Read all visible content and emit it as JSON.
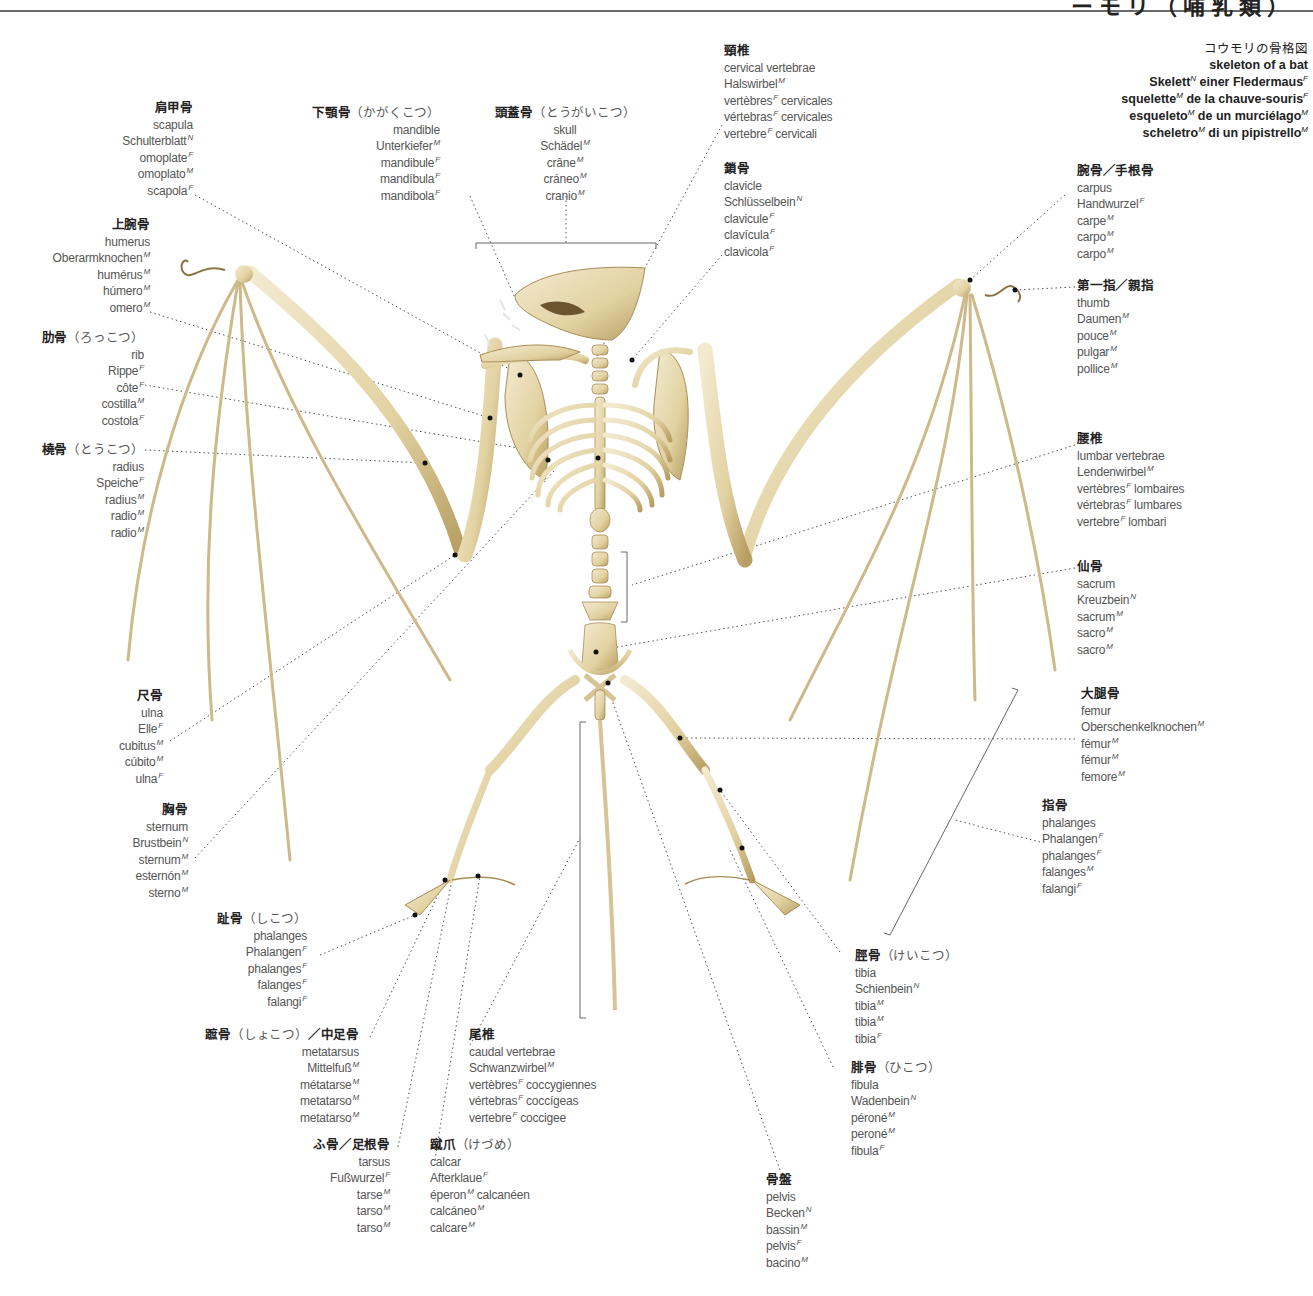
{
  "header": {
    "title_fragment": "ーモリ（哺乳類）"
  },
  "title_block": {
    "jp": "コウモリの骨格図",
    "lines": [
      {
        "text": "skeleton of a bat",
        "parts": []
      },
      {
        "text": "Skelett",
        "g1": "N",
        "rest": " einer Fledermaus",
        "g2": "F"
      },
      {
        "text": "squelette",
        "g1": "M",
        "rest": " de la chauve-souris",
        "g2": "F"
      },
      {
        "text": "esqueleto",
        "g1": "M",
        "rest": " de un murciélago",
        "g2": "M"
      },
      {
        "text": "scheletro",
        "g1": "M",
        "rest": " di un pipistrello",
        "g2": "M"
      }
    ]
  },
  "labels": {
    "scapula": {
      "jp": "肩甲骨",
      "reading": "",
      "terms": [
        [
          "scapula",
          ""
        ],
        [
          "Schulterblatt",
          "N"
        ],
        [
          "omoplate",
          "F"
        ],
        [
          "omoplato",
          "M"
        ],
        [
          "scapola",
          "F"
        ]
      ]
    },
    "humerus": {
      "jp": "上腕骨",
      "reading": "",
      "terms": [
        [
          "humerus",
          ""
        ],
        [
          "Oberarmknochen",
          "M"
        ],
        [
          "humérus",
          "M"
        ],
        [
          "húmero",
          "M"
        ],
        [
          "omero",
          "M"
        ]
      ]
    },
    "rib": {
      "jp": "肋骨",
      "reading": "（ろっこつ）",
      "terms": [
        [
          "rib",
          ""
        ],
        [
          "Rippe",
          "F"
        ],
        [
          "côte",
          "F"
        ],
        [
          "costilla",
          "M"
        ],
        [
          "costola",
          "F"
        ]
      ]
    },
    "radius": {
      "jp": "橈骨",
      "reading": "（とうこつ）",
      "terms": [
        [
          "radius",
          ""
        ],
        [
          "Speiche",
          "F"
        ],
        [
          "radius",
          "M"
        ],
        [
          "radio",
          "M"
        ],
        [
          "radio",
          "M"
        ]
      ]
    },
    "ulna": {
      "jp": "尺骨",
      "reading": "",
      "terms": [
        [
          "ulna",
          ""
        ],
        [
          "Elle",
          "F"
        ],
        [
          "cubitus",
          "M"
        ],
        [
          "cúbito",
          "M"
        ],
        [
          "ulna",
          "F"
        ]
      ]
    },
    "sternum": {
      "jp": "胸骨",
      "reading": "",
      "terms": [
        [
          "sternum",
          ""
        ],
        [
          "Brustbein",
          "N"
        ],
        [
          "sternum",
          "M"
        ],
        [
          "esternón",
          "M"
        ],
        [
          "sterno",
          "M"
        ]
      ]
    },
    "mandible": {
      "jp": "下顎骨",
      "reading": "（かがくこつ）",
      "terms": [
        [
          "mandible",
          ""
        ],
        [
          "Unterkiefer",
          "M"
        ],
        [
          "mandibule",
          "F"
        ],
        [
          "mandíbula",
          "F"
        ],
        [
          "mandibola",
          "F"
        ]
      ]
    },
    "skull": {
      "jp": "頭蓋骨",
      "reading": "（とうがいこつ）",
      "terms": [
        [
          "skull",
          ""
        ],
        [
          "Schädel",
          "M"
        ],
        [
          "crâne",
          "M"
        ],
        [
          "cráneo",
          "M"
        ],
        [
          "cranio",
          "M"
        ]
      ]
    },
    "cervical": {
      "jp": "頸椎",
      "reading": "",
      "terms": [
        [
          "cervical vertebrae",
          ""
        ],
        [
          "Halswirbel",
          "M"
        ],
        [
          "vertèbres",
          "F",
          " cervicales"
        ],
        [
          "vértebras",
          "F",
          " cervicales"
        ],
        [
          "vertebre",
          "F",
          " cervicali"
        ]
      ]
    },
    "clavicle": {
      "jp": "鎖骨",
      "reading": "",
      "terms": [
        [
          "clavicle",
          ""
        ],
        [
          "Schlüsselbein",
          "N"
        ],
        [
          "clavicule",
          "F"
        ],
        [
          "clavícula",
          "F"
        ],
        [
          "clavicola",
          "F"
        ]
      ]
    },
    "carpus": {
      "jp": "腕骨／手根骨",
      "reading": "",
      "terms": [
        [
          "carpus",
          ""
        ],
        [
          "Handwurzel",
          "F"
        ],
        [
          "carpe",
          "M"
        ],
        [
          "carpo",
          "M"
        ],
        [
          "carpo",
          "M"
        ]
      ]
    },
    "thumb": {
      "jp": "第一指／親指",
      "reading": "",
      "terms": [
        [
          "thumb",
          ""
        ],
        [
          "Daumen",
          "M"
        ],
        [
          "pouce",
          "M"
        ],
        [
          "pulgar",
          "M"
        ],
        [
          "pollice",
          "M"
        ]
      ]
    },
    "lumbar": {
      "jp": "腰椎",
      "reading": "",
      "terms": [
        [
          "lumbar vertebrae",
          ""
        ],
        [
          "Lendenwirbel",
          "M"
        ],
        [
          "vertèbres",
          "F",
          " lombaires"
        ],
        [
          "vértebras",
          "F",
          " lumbares"
        ],
        [
          "vertebre",
          "F",
          " lombari"
        ]
      ]
    },
    "sacrum": {
      "jp": "仙骨",
      "reading": "",
      "terms": [
        [
          "sacrum",
          ""
        ],
        [
          "Kreuzbein",
          "N"
        ],
        [
          "sacrum",
          "M"
        ],
        [
          "sacro",
          "M"
        ],
        [
          "sacro",
          "M"
        ]
      ]
    },
    "femur": {
      "jp": "大腿骨",
      "reading": "",
      "terms": [
        [
          "femur",
          ""
        ],
        [
          "Oberschenkelknochen",
          "M"
        ],
        [
          "fémur",
          "M"
        ],
        [
          "fémur",
          "M"
        ],
        [
          "femore",
          "M"
        ]
      ]
    },
    "phalanges_hand": {
      "jp": "指骨",
      "reading": "",
      "terms": [
        [
          "phalanges",
          ""
        ],
        [
          "Phalangen",
          "F"
        ],
        [
          "phalanges",
          "F"
        ],
        [
          "falanges",
          "M"
        ],
        [
          "falangi",
          "F"
        ]
      ]
    },
    "tibia": {
      "jp": "脛骨",
      "reading": "（けいこつ）",
      "terms": [
        [
          "tibia",
          ""
        ],
        [
          "Schienbein",
          "N"
        ],
        [
          "tibia",
          "M"
        ],
        [
          "tibia",
          "M"
        ],
        [
          "tibia",
          "F"
        ]
      ]
    },
    "fibula": {
      "jp": "腓骨",
      "reading": "（ひこつ）",
      "terms": [
        [
          "fibula",
          ""
        ],
        [
          "Wadenbein",
          "N"
        ],
        [
          "péroné",
          "M"
        ],
        [
          "peroné",
          "M"
        ],
        [
          "fibula",
          "F"
        ]
      ]
    },
    "pelvis": {
      "jp": "骨盤",
      "reading": "",
      "terms": [
        [
          "pelvis",
          ""
        ],
        [
          "Becken",
          "N"
        ],
        [
          "bassin",
          "M"
        ],
        [
          "pelvis",
          "F"
        ],
        [
          "bacino",
          "M"
        ]
      ]
    },
    "toe_phalanges": {
      "jp": "趾骨",
      "reading": "（しこつ）",
      "terms": [
        [
          "phalanges",
          ""
        ],
        [
          "Phalangen",
          "F"
        ],
        [
          "phalanges",
          "F"
        ],
        [
          "falanges",
          "F"
        ],
        [
          "falangi",
          "F"
        ]
      ]
    },
    "metatarsus": {
      "jp": "蹠骨",
      "reading": "（しょこつ）",
      "jp2": "／中足骨",
      "terms": [
        [
          "metatarsus",
          ""
        ],
        [
          "Mittelfuß",
          "M"
        ],
        [
          "métatarse",
          "M"
        ],
        [
          "metatarso",
          "M"
        ],
        [
          "metatarso",
          "M"
        ]
      ]
    },
    "tarsus": {
      "jp": "ふ骨／足根骨",
      "reading": "",
      "terms": [
        [
          "tarsus",
          ""
        ],
        [
          "Fußwurzel",
          "F"
        ],
        [
          "tarse",
          "M"
        ],
        [
          "tarso",
          "M"
        ],
        [
          "tarso",
          "M"
        ]
      ]
    },
    "caudal": {
      "jp": "尾椎",
      "reading": "",
      "terms": [
        [
          "caudal vertebrae",
          ""
        ],
        [
          "Schwanzwirbel",
          "M"
        ],
        [
          "vertèbres",
          "F",
          " coccygiennes"
        ],
        [
          "vértebras",
          "F",
          " coccígeas"
        ],
        [
          "vertebre",
          "F",
          " coccigee"
        ]
      ]
    },
    "calcar": {
      "jp": "蹴爪",
      "reading": "（けづめ）",
      "terms": [
        [
          "calcar",
          ""
        ],
        [
          "Afterklaue",
          "F"
        ],
        [
          "éperon",
          "M",
          " calcanéen"
        ],
        [
          "calcáneo",
          "M"
        ],
        [
          "calcare",
          "M"
        ]
      ]
    }
  },
  "colors": {
    "bone": "#e8dcb4",
    "bone_shade": "#b9a16c",
    "bone_dark": "#7a6536",
    "leader": "#555555",
    "text": "#555555"
  }
}
